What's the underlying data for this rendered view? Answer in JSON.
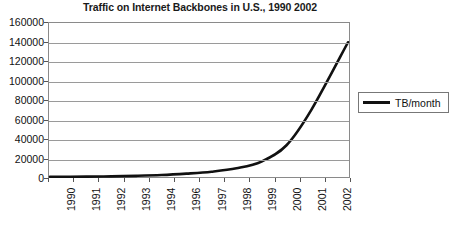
{
  "chart_data": {
    "type": "line",
    "title": "Traffic on Internet Backbones in U.S., 1990 2002",
    "xlabel": "",
    "ylabel": "",
    "categories": [
      "1990",
      "1991",
      "1992",
      "1993",
      "1994",
      "1996",
      "1997",
      "1998",
      "1999",
      "2000",
      "2001",
      "2002"
    ],
    "series": [
      {
        "name": "TB/month",
        "color": "#111111",
        "values": [
          200,
          400,
          700,
          1200,
          2000,
          3500,
          5500,
          9000,
          16000,
          33000,
          70000,
          140000
        ]
      }
    ],
    "ylim": [
      0,
      160000
    ],
    "yticks": [
      0,
      20000,
      40000,
      60000,
      80000,
      100000,
      120000,
      140000,
      160000
    ],
    "ytick_labels": [
      "0",
      "20000",
      "40000",
      "60000",
      "80000",
      "100000",
      "120000",
      "140000",
      "160000"
    ],
    "grid": "horizontal",
    "legend_position": "right",
    "legend_entries": [
      "TB/month"
    ]
  },
  "legend": {
    "swatch_name": "line-swatch",
    "label": "TB/month"
  }
}
